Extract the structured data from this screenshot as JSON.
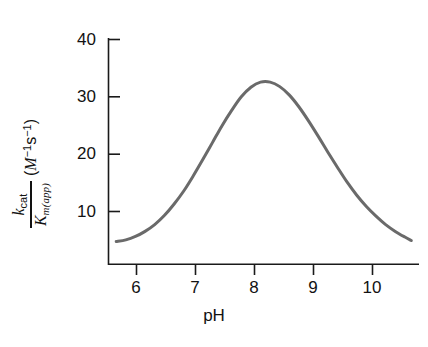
{
  "figure": {
    "background_color": "#ffffff",
    "curve_color": "#6a6a6a",
    "axis_color": "#1a1a1a",
    "text_color": "#121212"
  },
  "axes": {
    "x": {
      "label": "pH",
      "ticks": [
        "6",
        "7",
        "8",
        "9",
        "10"
      ],
      "tick_values": [
        6,
        7,
        8,
        9,
        10
      ],
      "range": [
        5.58,
        10.42
      ],
      "tick_direction": "outward"
    },
    "y": {
      "label_numerator": "k",
      "label_numerator_sub": "cat",
      "label_denominator": "K",
      "label_denominator_sub": "m(app)",
      "units_open": "(",
      "units_variable": "M",
      "units_exp1": "−1",
      "units_s": "s",
      "units_exp2": "−1",
      "units_close": ")",
      "ticks": [
        "10",
        "20",
        "30",
        "40"
      ],
      "tick_values": [
        10,
        20,
        30,
        40
      ],
      "range": [
        2.0,
        42.0
      ],
      "tick_direction": "inward"
    }
  },
  "chart_data": {
    "type": "line",
    "title": "",
    "xlabel": "pH",
    "ylabel": "k_cat / K_m(app) (M^-1 s^-1)",
    "xlim": [
      5.58,
      10.42
    ],
    "ylim": [
      2.0,
      42.0
    ],
    "grid": false,
    "legend": null,
    "series": [
      {
        "name": "pH rate profile",
        "color": "#6a6a6a",
        "line_width": 3.0,
        "peak_x": 8.0,
        "peak_y": 34.3,
        "x": [
          5.7,
          5.85,
          6.0,
          6.15,
          6.3,
          6.45,
          6.6,
          6.75,
          6.9,
          7.05,
          7.2,
          7.35,
          7.5,
          7.65,
          7.8,
          7.95,
          8.1,
          8.25,
          8.4,
          8.55,
          8.7,
          8.85,
          9.0,
          9.15,
          9.3,
          9.45,
          9.6,
          9.75,
          9.9,
          10.05,
          10.2,
          10.3
        ],
        "y": [
          6.0,
          6.3,
          6.9,
          7.8,
          9.0,
          10.6,
          12.6,
          14.9,
          17.6,
          20.5,
          23.5,
          26.5,
          29.2,
          31.6,
          33.3,
          34.2,
          34.2,
          33.4,
          31.9,
          29.8,
          27.3,
          24.6,
          21.8,
          19.1,
          16.5,
          14.2,
          12.2,
          10.5,
          9.0,
          7.8,
          6.8,
          6.2
        ]
      }
    ]
  }
}
